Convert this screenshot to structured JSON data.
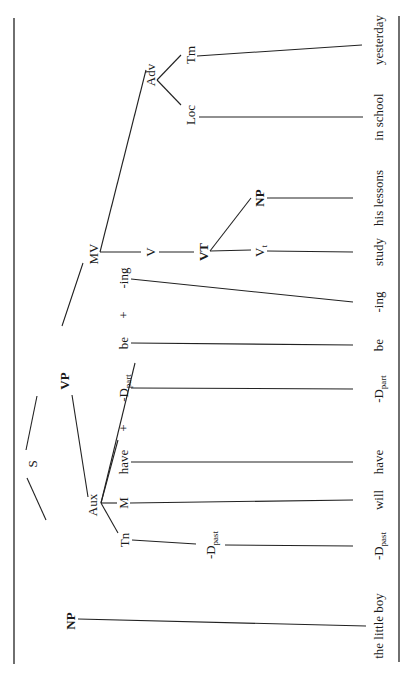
{
  "page": {
    "running_header": "INTRODUCTION TO",
    "page_number": "170"
  },
  "tree": {
    "orientation": "rotated 90° counter-clockwise (root at left, leaves at right)",
    "nodes": {
      "S": "S",
      "NP_subject": "NP",
      "VP": "VP",
      "Aux": "Aux",
      "Tn": "Tn",
      "D_past_mid": {
        "base": "-D",
        "sub": "past"
      },
      "M": "M",
      "have": "have",
      "plus1": "+",
      "D_part": {
        "base": "-D",
        "sub": "part"
      },
      "be": "be",
      "plus2": "+",
      "ing": "-ing",
      "MV": "MV",
      "V": "V",
      "VT": "VT",
      "Vt": {
        "base": "V",
        "sub": "t"
      },
      "NP_object": "NP",
      "Adv": "Adv",
      "Loc": "Loc",
      "Tm": "Tm"
    },
    "leaves": [
      {
        "id": "the_little_boy",
        "text": "the little boy"
      },
      {
        "id": "d_past",
        "base": "-D",
        "sub": "past"
      },
      {
        "id": "will",
        "text": "will"
      },
      {
        "id": "have",
        "text": "have"
      },
      {
        "id": "d_part",
        "base": "-D",
        "sub": "part"
      },
      {
        "id": "be",
        "text": "be"
      },
      {
        "id": "ing",
        "text": "-ing"
      },
      {
        "id": "study",
        "text": "study"
      },
      {
        "id": "his_lessons",
        "text": "his lessons"
      },
      {
        "id": "in_school",
        "text": "in school"
      },
      {
        "id": "yesterday",
        "text": "yesterday"
      }
    ]
  }
}
